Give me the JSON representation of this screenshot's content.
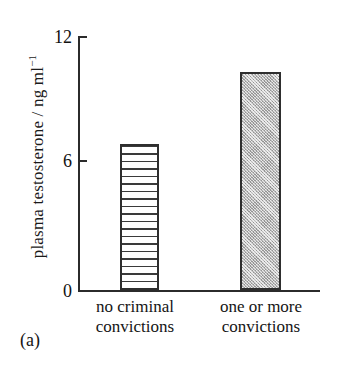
{
  "figure": {
    "panel_tag": "(a)"
  },
  "chart_data": {
    "type": "bar",
    "title": "",
    "subtitle": "",
    "xlabel": "",
    "ylabel": "plasma testosterone / ng ml",
    "ylabel_exponent": "−1",
    "ylabel_full": "plasma testosterone / ng ml⁻¹",
    "categories": [
      "no criminal convictions",
      "one or more convictions"
    ],
    "category_lines": [
      [
        "no criminal",
        "convictions"
      ],
      [
        "one or more",
        "convictions"
      ]
    ],
    "values": [
      6.9,
      10.3
    ],
    "ylim": [
      0,
      12
    ],
    "yticks": [
      0,
      6,
      12
    ],
    "ytick_labels": [
      "0",
      "6",
      "12"
    ],
    "grid": false,
    "legend": null,
    "bar_fills": [
      "horizontal-hatch",
      "stipple-gray"
    ],
    "colors": {
      "axis": "#2b2b2b",
      "bar_outline": "#2e2e2e",
      "bar_hatch_line": "#3a3a3a",
      "bar_stipple": "#b9b9b9",
      "background": "#ffffff",
      "text": "#141414"
    }
  }
}
